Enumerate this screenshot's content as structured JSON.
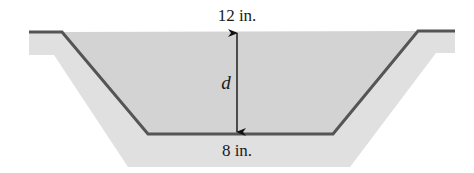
{
  "diagram": {
    "type": "trapezoidal-channel-cross-section",
    "labels": {
      "top_width": "12 in.",
      "bottom_width": "8 in.",
      "depth": "d"
    },
    "colors": {
      "water_fill": "#d3d3d3",
      "ground_band": "#e0e0e0",
      "channel_line": "#555555",
      "arrow": "#111111",
      "background": "#ffffff"
    }
  }
}
